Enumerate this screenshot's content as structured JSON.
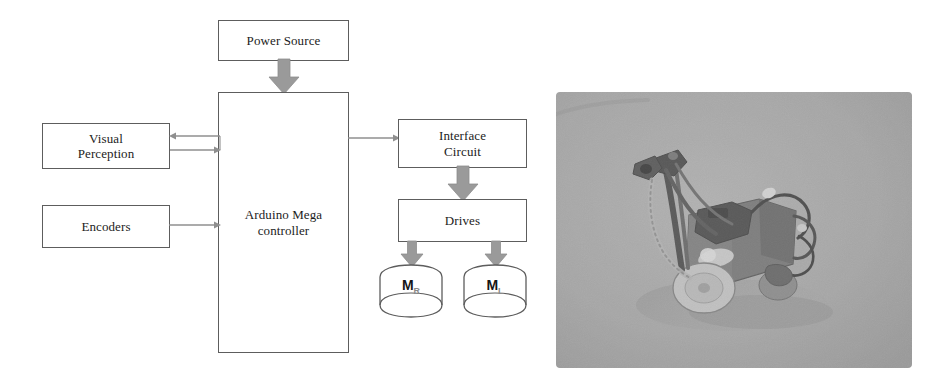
{
  "figure": {
    "kind": "system-block-diagram-with-photo",
    "background_color": "#ffffff",
    "box_border_color": "#5d5d5d",
    "arrow_color": "#9a9a9a",
    "text_color": "#1c1c1c"
  },
  "diagram": {
    "blocks": {
      "power_source": "Power Source",
      "controller": "Arduino Mega\ncontroller",
      "controller_line1": "Arduino Mega",
      "controller_line2": "controller",
      "visual_perception_line1": "Visual",
      "visual_perception_line2": "Perception",
      "encoders": "Encoders",
      "interface_circuit_line1": "Interface",
      "interface_circuit_line2": "Circuit",
      "drives": "Drives",
      "motor_right_base": "M",
      "motor_right_sub": "R",
      "motor_left_base": "M",
      "motor_left_sub": "L"
    },
    "connectors": [
      {
        "name": "power-to-controller",
        "style": "block-arrow",
        "direction": "down"
      },
      {
        "name": "controller-to-visual-perception",
        "style": "thin-arrow",
        "direction": "left"
      },
      {
        "name": "visual-perception-to-controller",
        "style": "thin-arrow",
        "direction": "right"
      },
      {
        "name": "encoders-to-controller",
        "style": "thin-arrow",
        "direction": "right"
      },
      {
        "name": "controller-to-interface-circuit",
        "style": "thin-arrow",
        "direction": "right"
      },
      {
        "name": "interface-circuit-to-drives",
        "style": "block-arrow",
        "direction": "down"
      },
      {
        "name": "drives-to-motor-right",
        "style": "block-arrow",
        "direction": "down"
      },
      {
        "name": "drives-to-motor-left",
        "style": "block-arrow",
        "direction": "down"
      }
    ]
  },
  "photo": {
    "subject": "mobile robot prototype with camera mast on grey background",
    "background_color": "#a8a8a8"
  }
}
